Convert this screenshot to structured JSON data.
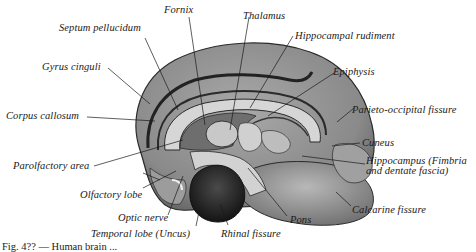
{
  "figure": {
    "caption": "Fig. 4?? — Human brain ...",
    "labels": [
      {
        "id": "fornix",
        "text": "Fornix"
      },
      {
        "id": "thalamus",
        "text": "Thalamus"
      },
      {
        "id": "septum",
        "text": "Septum pellucidum"
      },
      {
        "id": "hippocampal-rudiment",
        "text": "Hippocampal rudiment"
      },
      {
        "id": "gyrus-cinguli",
        "text": "Gyrus cinguli"
      },
      {
        "id": "epiphysis",
        "text": "Epiphysis"
      },
      {
        "id": "corpus-callosum",
        "text": "Corpus callosum"
      },
      {
        "id": "parieto-occipital",
        "text": "Parieto-occipital fissure"
      },
      {
        "id": "cuneus",
        "text": "Cuneus"
      },
      {
        "id": "parolfactory",
        "text": "Parolfactory area"
      },
      {
        "id": "hippocampus",
        "text": "Hippocampus (Fimbria and dentate fascia)"
      },
      {
        "id": "olfactory-lobe",
        "text": "Olfactory lobe"
      },
      {
        "id": "calcarine",
        "text": "Calcarine fissure"
      },
      {
        "id": "optic-nerve",
        "text": "Optic nerve"
      },
      {
        "id": "pons",
        "text": "Pons"
      },
      {
        "id": "temporal-lobe",
        "text": "Temporal lobe (Uncus)"
      },
      {
        "id": "rhinal",
        "text": "Rhinal fissure"
      }
    ],
    "colors": {
      "ink": "#1a1a1a",
      "cortex": "#8f8f8f",
      "cortex_dark": "#5a5a5a",
      "light": "#d4d4d4",
      "uncus": "#262626"
    }
  }
}
